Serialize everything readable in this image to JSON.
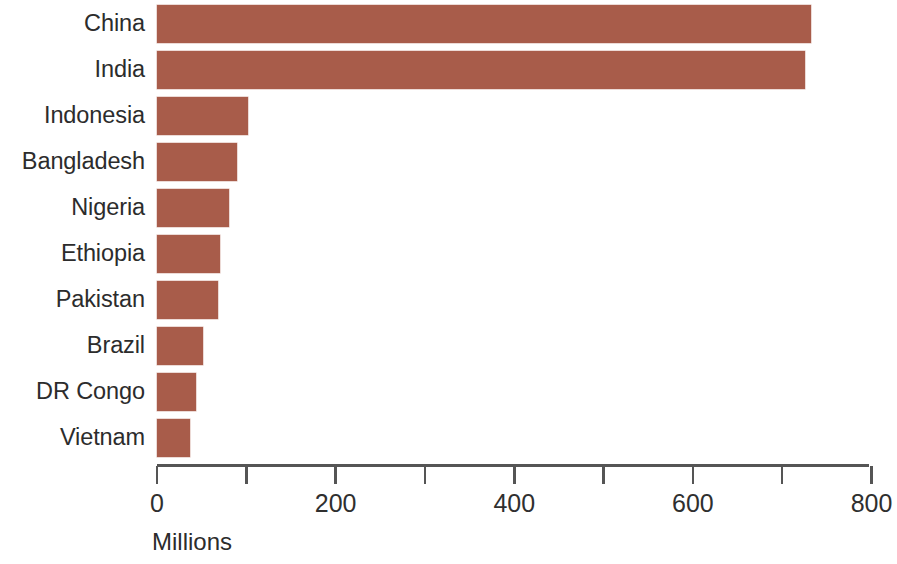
{
  "chart_data": {
    "type": "bar",
    "orientation": "horizontal",
    "title": "",
    "subtitle": "",
    "xlabel": "Millions",
    "ylabel": "",
    "categories": [
      "China",
      "India",
      "Indonesia",
      "Bangladesh",
      "Nigeria",
      "Ethiopia",
      "Pakistan",
      "Brazil",
      "DR Congo",
      "Vietnam"
    ],
    "values": [
      732,
      726,
      102,
      90,
      81,
      70,
      68,
      52,
      44,
      37
    ],
    "xlim": [
      0,
      800
    ],
    "ylim": null,
    "grid": false,
    "legend": null,
    "bar_color": "#a85c4a",
    "axis_color": "#555555",
    "text_color": "#2c2c2c",
    "x_major_ticks": [
      0,
      200,
      400,
      600,
      800
    ],
    "x_minor_ticks": [
      100,
      300,
      500,
      700
    ],
    "x_tick_labels": [
      "0",
      "200",
      "400",
      "600",
      "800"
    ]
  },
  "axis": {
    "title": "Millions",
    "tick_labels": [
      "0",
      "200",
      "400",
      "600",
      "800"
    ]
  },
  "bars": [
    {
      "label": "China",
      "value": 732
    },
    {
      "label": "India",
      "value": 726
    },
    {
      "label": "Indonesia",
      "value": 102
    },
    {
      "label": "Bangladesh",
      "value": 90
    },
    {
      "label": "Nigeria",
      "value": 81
    },
    {
      "label": "Ethiopia",
      "value": 70
    },
    {
      "label": "Pakistan",
      "value": 68
    },
    {
      "label": "Brazil",
      "value": 52
    },
    {
      "label": "DR Congo",
      "value": 44
    },
    {
      "label": "Vietnam",
      "value": 37
    }
  ]
}
